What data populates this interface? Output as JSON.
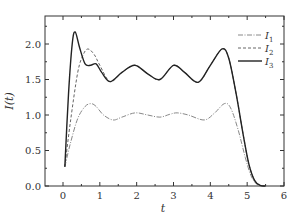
{
  "chart_data": {
    "type": "line",
    "title": "",
    "xlabel": "t",
    "ylabel": "I(t)",
    "xlim": [
      -0.5,
      6
    ],
    "ylim": [
      0,
      2.4
    ],
    "xticks": [
      0,
      1,
      2,
      3,
      4,
      5,
      6
    ],
    "yticks": [
      0.0,
      0.5,
      1.0,
      1.5,
      2.0
    ],
    "xtick_labels": [
      "0",
      "1",
      "2",
      "3",
      "4",
      "5",
      "6"
    ],
    "ytick_labels": [
      "0.0",
      "0.5",
      "1.0",
      "1.5",
      "2.0"
    ],
    "grid": false,
    "legend_position": "upper right",
    "series": [
      {
        "name": "I1",
        "label_main": "I",
        "label_sub": "1",
        "style": "dash-dot",
        "color": "#888888",
        "x": [
          0.05,
          0.2,
          0.4,
          0.6,
          0.76,
          0.9,
          1.1,
          1.36,
          1.6,
          1.96,
          2.3,
          2.63,
          2.9,
          3.1,
          3.4,
          3.83,
          4.1,
          4.38,
          4.55,
          4.75,
          4.95,
          5.1,
          5.25,
          5.4,
          5.5
        ],
        "y": [
          0.27,
          0.6,
          0.95,
          1.12,
          1.16,
          1.12,
          1.0,
          0.93,
          0.97,
          1.03,
          1.0,
          0.97,
          1.01,
          1.03,
          1.0,
          0.93,
          1.02,
          1.16,
          1.1,
          0.8,
          0.4,
          0.15,
          0.03,
          0.0,
          0.0
        ]
      },
      {
        "name": "I2",
        "label_main": "I",
        "label_sub": "2",
        "style": "dashed",
        "color": "#666666",
        "x": [
          0.05,
          0.2,
          0.4,
          0.55,
          0.68,
          0.85,
          1.0,
          1.28,
          1.6,
          1.95,
          2.3,
          2.63,
          3.0,
          3.3,
          3.67,
          4.0,
          4.32,
          4.5,
          4.7,
          4.9,
          5.05,
          5.2,
          5.35,
          5.5
        ],
        "y": [
          0.27,
          0.9,
          1.6,
          1.85,
          1.93,
          1.85,
          1.7,
          1.47,
          1.6,
          1.7,
          1.58,
          1.5,
          1.7,
          1.6,
          1.46,
          1.7,
          1.93,
          1.8,
          1.3,
          0.7,
          0.3,
          0.08,
          0.01,
          0.0
        ]
      },
      {
        "name": "I3",
        "label_main": "I",
        "label_sub": "3",
        "style": "solid",
        "color": "#222222",
        "x": [
          0.05,
          0.15,
          0.25,
          0.33,
          0.45,
          0.6,
          0.75,
          0.9,
          1.05,
          1.28,
          1.6,
          1.95,
          2.3,
          2.63,
          3.0,
          3.3,
          3.67,
          4.0,
          4.32,
          4.5,
          4.7,
          4.9,
          5.05,
          5.2,
          5.35,
          5.5
        ],
        "y": [
          0.27,
          1.3,
          2.0,
          2.17,
          1.95,
          1.72,
          1.7,
          1.72,
          1.6,
          1.47,
          1.6,
          1.7,
          1.58,
          1.5,
          1.7,
          1.6,
          1.46,
          1.7,
          1.93,
          1.8,
          1.3,
          0.7,
          0.3,
          0.08,
          0.01,
          0.0
        ]
      }
    ]
  }
}
